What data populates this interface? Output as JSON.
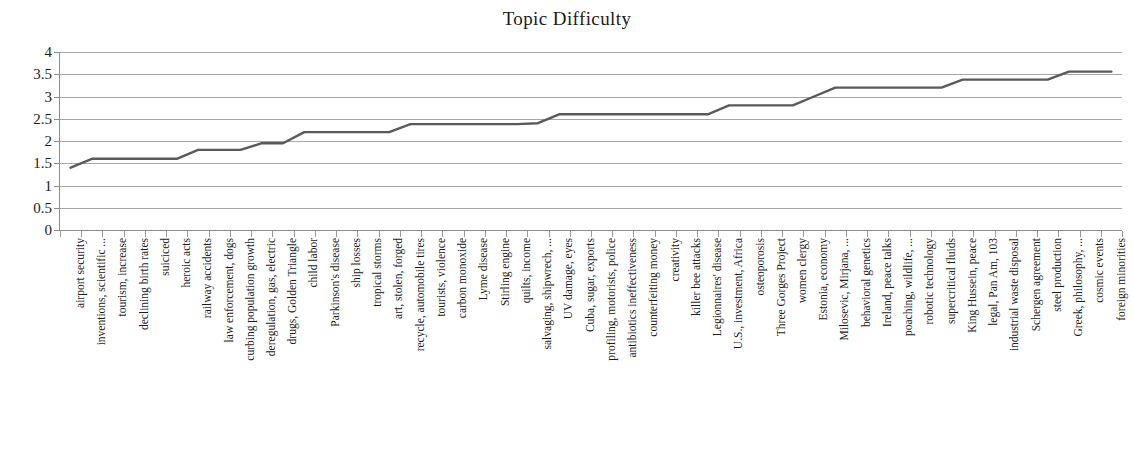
{
  "chart_data": {
    "type": "line",
    "title": "Topic Difficulty",
    "xlabel": "",
    "ylabel": "",
    "ylim": [
      0,
      4
    ],
    "ytick_step": 0.5,
    "grid": true,
    "legend": "none",
    "line_color": "#5a5a5a",
    "gridline_color": "#a6a6a6",
    "axis_color": "#8c8c8c",
    "yticks": [
      "0",
      "0.5",
      "1",
      "1.5",
      "2",
      "2.5",
      "3",
      "3.5",
      "4"
    ],
    "categories": [
      "airport security",
      "inventions, scientific ...",
      "tourism, increase",
      "declining birth rates",
      "suiciced",
      "heroic acts",
      "railway accidents",
      "law enforcement, dogs",
      "curbing population growth",
      "deregulation, gas, electric",
      "drugs, Golden Triangle",
      "child labor",
      "Parkinson's disease",
      "ship losses",
      "tropical storms",
      "art, stolen, forged",
      "recycle, automobile tires",
      "tourists, violence",
      "carbon monoxide",
      "Lyme disease",
      "Stirling engine",
      "quilts, income",
      "salvaging, shipwrech, ...",
      "UV damage, eyes",
      "Cuba, sugar, exports",
      "profiling, motorists, police",
      "antibiotics ineffectiveness",
      "counterfeiting money",
      "creativity",
      "killer bee attacks",
      "Legionnaires' disease",
      "U.S., investment, Africa",
      "osteoporosis",
      "Three Gorges Project",
      "women clergy",
      "Estonia, economy",
      "Milosevic, Mirjana, ...",
      "behavioral genetics",
      "Ireland, peace talks",
      "poaching, wildlife, ...",
      "robotic technology",
      "supercritical fluids",
      "King Hussein, peace",
      "legal, Pan Am, 103",
      "industrial waste disposal",
      "Schergen agreement",
      "steel production",
      "Greek, philosophy, ...",
      "cosmic events",
      "foreign minorities"
    ],
    "values": [
      1.4,
      1.6,
      1.6,
      1.6,
      1.6,
      1.6,
      1.8,
      1.8,
      1.8,
      1.95,
      1.95,
      2.2,
      2.2,
      2.2,
      2.2,
      2.2,
      2.38,
      2.38,
      2.38,
      2.38,
      2.38,
      2.38,
      2.4,
      2.6,
      2.6,
      2.6,
      2.6,
      2.6,
      2.6,
      2.6,
      2.6,
      2.8,
      2.8,
      2.8,
      2.8,
      3.0,
      3.2,
      3.2,
      3.2,
      3.2,
      3.2,
      3.2,
      3.38,
      3.38,
      3.38,
      3.38,
      3.38,
      3.56,
      3.56,
      3.56
    ]
  }
}
